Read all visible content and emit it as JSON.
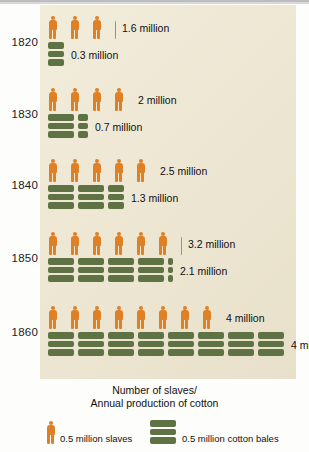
{
  "chart_data": {
    "type": "bar",
    "title": "Number of slaves/\nAnnual production of cotton",
    "title_line1": "Number of slaves/",
    "title_line2": "Annual production of cotton",
    "xlabel": "",
    "ylabel": "",
    "categories": [
      "1820",
      "1830",
      "1840",
      "1850",
      "1860"
    ],
    "unit_per_icon": 0.5,
    "series": [
      {
        "name": "0.5 million slaves",
        "icon": "person-icon",
        "color": "#de8026",
        "values": [
          1.6,
          2.0,
          2.5,
          3.2,
          4.0
        ],
        "labels": [
          "1.6 million",
          "2 million",
          "2.5 million",
          "3.2 million",
          "4 million"
        ]
      },
      {
        "name": "0.5 million cotton bales",
        "icon": "cotton-bale-icon",
        "color": "#5f7244",
        "values": [
          0.3,
          0.7,
          1.3,
          2.1,
          4.0
        ],
        "labels": [
          "0.3 million",
          "0.7 million",
          "1.3 million",
          "2.1 million",
          "4 million"
        ]
      }
    ],
    "legend": [
      {
        "label": "0.5 million slaves",
        "icon": "person-icon",
        "color": "#de8026"
      },
      {
        "label": "0.5 million cotton bales",
        "icon": "cotton-bale-icon",
        "color": "#5f7244"
      }
    ],
    "legend_position": "bottom",
    "grid": false,
    "panel_color": "#efe9d7"
  },
  "rows": [
    {
      "year": "1820",
      "slaves": {
        "label": "1.6 million",
        "full": 3,
        "partial": 0.2
      },
      "bales": {
        "label": "0.3 million",
        "full": 0,
        "partial": 0.6
      }
    },
    {
      "year": "1830",
      "slaves": {
        "label": "2 million",
        "full": 4,
        "partial": 0
      },
      "bales": {
        "label": "0.7 million",
        "full": 1,
        "partial": 0.4
      }
    },
    {
      "year": "1840",
      "slaves": {
        "label": "2.5 million",
        "full": 5,
        "partial": 0
      },
      "bales": {
        "label": "1.3 million",
        "full": 2,
        "partial": 0.6
      }
    },
    {
      "year": "1850",
      "slaves": {
        "label": "3.2 million",
        "full": 6,
        "partial": 0.2
      },
      "bales": {
        "label": "2.1 million",
        "full": 4,
        "partial": 0.2
      }
    },
    {
      "year": "1860",
      "slaves": {
        "label": "4 million",
        "full": 8,
        "partial": 0
      },
      "bales": {
        "label": "4 million",
        "full": 8,
        "partial": 0
      }
    }
  ],
  "caption": {
    "line1": "Number of slaves/",
    "line2": "Annual production of cotton"
  },
  "legend": {
    "slaves_label": "0.5 million slaves",
    "bales_label": "0.5 million cotton bales"
  }
}
